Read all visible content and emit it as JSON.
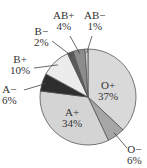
{
  "chart_data": {
    "type": "pie",
    "title": "",
    "categories": [
      "O+",
      "O−",
      "A+",
      "A−",
      "B+",
      "B−",
      "AB+",
      "AB−"
    ],
    "values": [
      37,
      6,
      34,
      6,
      10,
      2,
      4,
      1
    ],
    "labels": [
      "37%",
      "6%",
      "34%",
      "6%",
      "10%",
      "2%",
      "4%",
      "1%"
    ],
    "colors": [
      "#d9d9d9",
      "#a6a6a6",
      "#d4d4d4",
      "#2e2e2e",
      "#ececec",
      "#5a5a5a",
      "#8c8c8c",
      "#cfcfcf"
    ],
    "start_angle": "12 o'clock",
    "direction": "clockwise",
    "legend": "none (leader-line labels)"
  },
  "labels": {
    "o_pos": {
      "name": "O+",
      "pct": "37%"
    },
    "o_neg": {
      "name": "O−",
      "pct": "6%"
    },
    "a_pos": {
      "name": "A+",
      "pct": "34%"
    },
    "a_neg": {
      "name": "A−",
      "pct": "6%"
    },
    "b_pos": {
      "name": "B+",
      "pct": "10%"
    },
    "b_neg": {
      "name": "B−",
      "pct": "2%"
    },
    "ab_pos": {
      "name": "AB+",
      "pct": "4%"
    },
    "ab_neg": {
      "name": "AB−",
      "pct": "1%"
    }
  }
}
